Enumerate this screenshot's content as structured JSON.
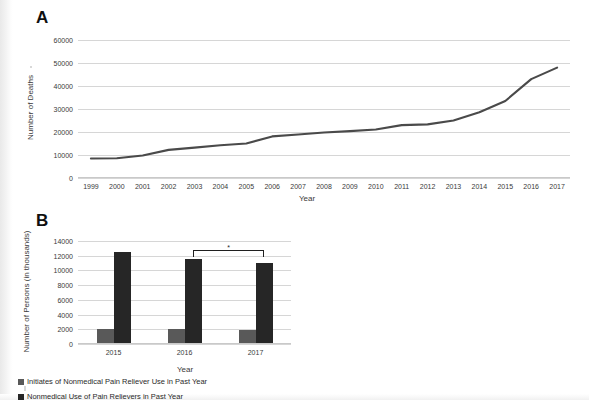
{
  "figure": {
    "panel_a_letter": "A",
    "panel_b_letter": "B"
  },
  "chart_data": [
    {
      "id": "panel-a",
      "type": "line",
      "title": "",
      "xlabel": "Year",
      "ylabel": "Number of Deaths",
      "ylim": [
        0,
        60000
      ],
      "yticks": [
        0,
        10000,
        20000,
        30000,
        40000,
        50000,
        60000
      ],
      "ytick_labels": [
        "0",
        "10000",
        "20000",
        "30000",
        "40000",
        "50000",
        "60000"
      ],
      "grid": true,
      "legend": "none",
      "categories": [
        "1999",
        "2000",
        "2001",
        "2002",
        "2003",
        "2004",
        "2005",
        "2006",
        "2007",
        "2008",
        "2009",
        "2010",
        "2011",
        "2012",
        "2013",
        "2014",
        "2015",
        "2016",
        "2017"
      ],
      "values": [
        8500,
        8600,
        9800,
        12200,
        13200,
        14200,
        15000,
        18100,
        18900,
        19800,
        20400,
        21100,
        23000,
        23300,
        25000,
        28600,
        33500,
        43000,
        48000
      ],
      "series_color": "#4a4a4a"
    },
    {
      "id": "panel-b",
      "type": "bar",
      "title": "",
      "xlabel": "Year",
      "ylabel": "Number of Persons (in thousands)",
      "ylim": [
        0,
        14000
      ],
      "yticks": [
        0,
        2000,
        4000,
        6000,
        8000,
        10000,
        12000,
        14000
      ],
      "ytick_labels": [
        "0",
        "2000",
        "4000",
        "6000",
        "8000",
        "10000",
        "12000",
        "14000"
      ],
      "grid": true,
      "legend": "bottom",
      "categories": [
        "2015",
        "2016",
        "2017"
      ],
      "series": [
        {
          "name": "Initiates of Nonmedical Pain Reliever Use in Past Year",
          "values": [
            2050,
            2100,
            1900
          ],
          "color": "#595959"
        },
        {
          "name": "Nonmedical Use of Pain Relievers in Past Year",
          "values": [
            12500,
            11500,
            11000
          ],
          "color": "#262626"
        }
      ],
      "annotations": [
        {
          "type": "significance-bracket",
          "label": "*",
          "from_category": "2016",
          "to_category": "2017",
          "series": "Nonmedical Use of Pain Relievers in Past Year"
        }
      ]
    }
  ],
  "legend": {
    "items": [
      {
        "label": "Initiates of Nonmedical Pain Reliever Use in Past Year",
        "color": "#595959"
      },
      {
        "label": "Nonmedical Use of Pain Relievers in Past Year",
        "color": "#262626"
      }
    ]
  }
}
